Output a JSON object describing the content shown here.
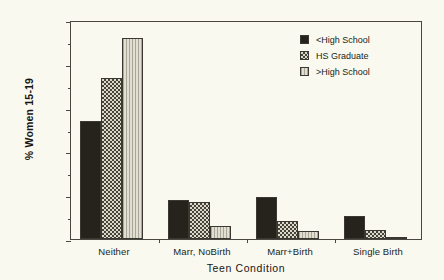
{
  "chart_data": {
    "type": "bar",
    "title": "",
    "xlabel": "Teen Condition",
    "ylabel": "% Women 15-19",
    "ylim": [
      0,
      100
    ],
    "yticks": [
      0,
      20,
      40,
      60,
      80,
      100
    ],
    "yminorticks": [
      10,
      30,
      50,
      70,
      90
    ],
    "grid": false,
    "legend_position": "top-right",
    "categories": [
      "Neither",
      "Marr, NoBirth",
      "Marr+Birth",
      "Single Birth"
    ],
    "series": [
      {
        "name": "<High School",
        "values": [
          54,
          18,
          19,
          10.5
        ],
        "color": "#26231d",
        "pattern": "solid"
      },
      {
        "name": "HS Graduate",
        "values": [
          73.5,
          17,
          8,
          4
        ],
        "color": "#ddd9c8",
        "pattern": "checker"
      },
      {
        "name": ">High School",
        "values": [
          92,
          6,
          3.5,
          1
        ],
        "color": "#cbc8bb",
        "pattern": "vertical-lines"
      }
    ]
  },
  "legend": {
    "items": [
      {
        "label": "<High School"
      },
      {
        "label": "HS Graduate"
      },
      {
        "label": ">High School"
      }
    ]
  }
}
